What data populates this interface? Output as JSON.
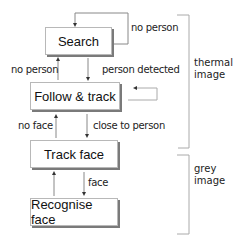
{
  "diagram": {
    "nodes": [
      {
        "id": "search",
        "label": "Search"
      },
      {
        "id": "follow",
        "label": "Follow & track"
      },
      {
        "id": "trackface",
        "label": "Track face"
      },
      {
        "id": "recognise",
        "label": "Recognise face"
      }
    ],
    "edges": {
      "search_self": "no person",
      "follow_to_search": "no person",
      "search_to_follow": "person detected",
      "trackface_to_follow": "no face",
      "follow_to_trackface": "close to person",
      "trackface_to_recognise": "face"
    },
    "groups": [
      {
        "label_line1": "thermal",
        "label_line2": "image"
      },
      {
        "label_line1": "grey",
        "label_line2": "image"
      }
    ]
  }
}
